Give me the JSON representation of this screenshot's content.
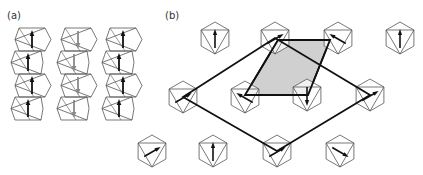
{
  "panels": {
    "a": {
      "label": "(a)"
    },
    "b": {
      "label": "(b)"
    }
  },
  "colors": {
    "line": "#555555",
    "bold_line": "#111111",
    "arrow_dark": "#111111",
    "arrow_gray": "#8a8a8a",
    "shade": "#d0d0d0"
  },
  "chains": [
    {
      "x": 30,
      "arrow": "up",
      "color": "dark"
    },
    {
      "x": 76,
      "arrow": "down",
      "color": "gray"
    },
    {
      "x": 121,
      "arrow": "up",
      "color": "dark"
    }
  ],
  "hexagons": [
    {
      "cx": 215,
      "cy": 38,
      "arrow_angle": 0
    },
    {
      "cx": 275,
      "cy": 38,
      "arrow_angle": 60
    },
    {
      "cx": 338,
      "cy": 38,
      "arrow_angle": -60
    },
    {
      "cx": 400,
      "cy": 38,
      "arrow_angle": 0
    },
    {
      "cx": 183,
      "cy": 97,
      "arrow_angle": 60
    },
    {
      "cx": 245,
      "cy": 97,
      "arrow_angle": -60
    },
    {
      "cx": 307,
      "cy": 95,
      "arrow_angle": 180
    },
    {
      "cx": 370,
      "cy": 95,
      "arrow_angle": 60
    },
    {
      "cx": 152,
      "cy": 151,
      "arrow_angle": 60
    },
    {
      "cx": 213,
      "cy": 151,
      "arrow_angle": 0
    },
    {
      "cx": 277,
      "cy": 151,
      "arrow_angle": 60
    },
    {
      "cx": 340,
      "cy": 151,
      "arrow_angle": 120
    }
  ],
  "big_diamond": [
    [
      183,
      97
    ],
    [
      275,
      38
    ],
    [
      370,
      95
    ],
    [
      277,
      151
    ]
  ],
  "unit_cell": [
    [
      278,
      40
    ],
    [
      330,
      40
    ],
    [
      308,
      95
    ],
    [
      245,
      95
    ]
  ]
}
